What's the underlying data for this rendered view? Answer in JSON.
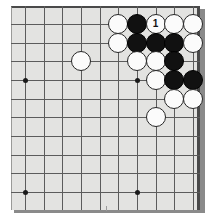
{
  "app": {
    "title": "Go Board Diagram",
    "kind": "go-game-diagram"
  },
  "board": {
    "background_color": "#e3e3e1",
    "line_color": "#5c5c5c",
    "edge_color": "#3a3a3a",
    "shadow_color": "#8a8a8a",
    "columns": 10,
    "rows": 11,
    "corner": "top-right",
    "star_points": [
      {
        "col": 1,
        "row": 4
      },
      {
        "col": 7,
        "row": 4
      },
      {
        "col": 1,
        "row": 10
      },
      {
        "col": 7,
        "row": 10
      }
    ]
  },
  "stones": [
    {
      "id": "s1",
      "col": 6,
      "row": 1,
      "color": "white",
      "label": ""
    },
    {
      "id": "s2",
      "col": 7,
      "row": 1,
      "color": "black",
      "label": ""
    },
    {
      "id": "s3",
      "col": 8,
      "row": 1,
      "color": "white",
      "label": "1"
    },
    {
      "id": "s4",
      "col": 9,
      "row": 1,
      "color": "white",
      "label": ""
    },
    {
      "id": "s5",
      "col": 10,
      "row": 1,
      "color": "white",
      "label": ""
    },
    {
      "id": "s6",
      "col": 6,
      "row": 2,
      "color": "white",
      "label": ""
    },
    {
      "id": "s7",
      "col": 7,
      "row": 2,
      "color": "black",
      "label": ""
    },
    {
      "id": "s8",
      "col": 8,
      "row": 2,
      "color": "black",
      "label": ""
    },
    {
      "id": "s9",
      "col": 9,
      "row": 2,
      "color": "black",
      "label": ""
    },
    {
      "id": "s10",
      "col": 10,
      "row": 2,
      "color": "white",
      "label": ""
    },
    {
      "id": "s11",
      "col": 4,
      "row": 3,
      "color": "white",
      "label": ""
    },
    {
      "id": "s12",
      "col": 7,
      "row": 3,
      "color": "white",
      "label": ""
    },
    {
      "id": "s13",
      "col": 8,
      "row": 3,
      "color": "white",
      "label": ""
    },
    {
      "id": "s14",
      "col": 9,
      "row": 3,
      "color": "black",
      "label": ""
    },
    {
      "id": "s15",
      "col": 8,
      "row": 4,
      "color": "white",
      "label": ""
    },
    {
      "id": "s16",
      "col": 9,
      "row": 4,
      "color": "black",
      "label": ""
    },
    {
      "id": "s17",
      "col": 10,
      "row": 4,
      "color": "black",
      "label": ""
    },
    {
      "id": "s18",
      "col": 9,
      "row": 5,
      "color": "white",
      "label": ""
    },
    {
      "id": "s19",
      "col": 10,
      "row": 5,
      "color": "white",
      "label": ""
    },
    {
      "id": "s20",
      "col": 8,
      "row": 6,
      "color": "white",
      "label": ""
    }
  ],
  "move_markers": [
    {
      "number": "1",
      "col": 8,
      "row": 1,
      "stone_color": "white"
    }
  ]
}
